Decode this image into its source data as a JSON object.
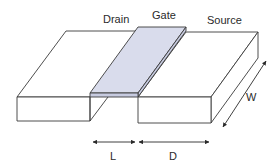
{
  "diagram": {
    "labels": {
      "drain": "Drain",
      "gate": "Gate",
      "source": "Source",
      "width": "W",
      "length": "L",
      "distance": "D"
    },
    "colors": {
      "gate_fill": "#d9dcec",
      "gate_side": "#c7cbe0",
      "block_fill": "#ffffff",
      "stroke": "#3a3a3a"
    },
    "nodes": [
      {
        "id": "drain",
        "label": "Drain",
        "shape": "block"
      },
      {
        "id": "gate",
        "label": "Gate",
        "shape": "thin-strip"
      },
      {
        "id": "source",
        "label": "Source",
        "shape": "block"
      }
    ],
    "dimensions": [
      {
        "id": "L",
        "label": "L",
        "from": "drain",
        "to": "gate",
        "meaning": "gate length"
      },
      {
        "id": "D",
        "label": "D",
        "from": "gate",
        "to": "source",
        "meaning": "source width"
      },
      {
        "id": "W",
        "label": "W",
        "meaning": "device depth"
      }
    ]
  }
}
